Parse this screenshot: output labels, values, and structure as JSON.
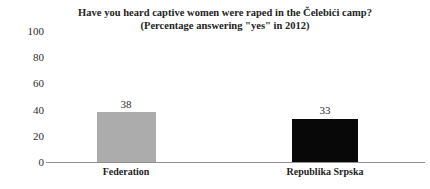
{
  "chart_data": {
    "type": "bar",
    "title": "Have you heard captive women were raped in the Čelebići camp?",
    "subtitle": "(Percentage answering \"yes\" in 2012)",
    "xlabel": "",
    "ylabel": "",
    "ylim": [
      0,
      100
    ],
    "yticks": [
      100,
      80,
      60,
      40,
      20,
      0
    ],
    "ytick_labels": [
      "100",
      "80",
      "60",
      "40",
      "20",
      "0"
    ],
    "grid": false,
    "legend": false,
    "categories": [
      "Federation",
      "Republika Srpska"
    ],
    "values": [
      38,
      33
    ],
    "value_labels": [
      "38",
      "33"
    ],
    "bar_colors": [
      "#ACACAC",
      "#080808"
    ],
    "axis_color": "#8F8F8F"
  }
}
